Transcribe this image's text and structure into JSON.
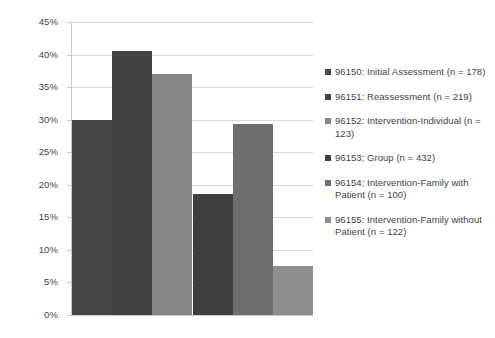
{
  "chart_data": {
    "type": "bar",
    "title": "",
    "subtitle": "",
    "xlabel": "",
    "ylabel": "",
    "ylim": [
      0,
      45
    ],
    "grid": true,
    "legend_position": "right",
    "y_tick_labels": [
      "45%",
      "40%",
      "35%",
      "30%",
      "25%",
      "20%",
      "15%",
      "10%",
      "5%",
      "0%"
    ],
    "y_tick_values": [
      45,
      40,
      35,
      30,
      25,
      20,
      15,
      10,
      5,
      0
    ],
    "x_tick_labels": [],
    "categories": [
      "96150: Initial Assessment (n = 178)",
      "96151: Reassessment (n = 219)",
      "96152: Intervention-Individual (n = 123)",
      "96153: Group (n = 432)",
      "96154: Intervention-Family with Patient (n = 100)",
      "96155: Intervention-Family without Patient (n = 122)"
    ],
    "values": [
      30.0,
      40.5,
      37.0,
      18.6,
      29.3,
      7.5
    ],
    "colors": [
      "#474747",
      "#434343",
      "#858585",
      "#3f3f3f",
      "#6e6e6e",
      "#8d8d8d"
    ]
  },
  "legend": {
    "items": [
      {
        "label": "96150: Initial Assessment (n = 178)",
        "color": "#474747"
      },
      {
        "label": "96151: Reassessment (n = 219)",
        "color": "#434343"
      },
      {
        "label": "96152: Intervention-Individual (n = 123)",
        "color": "#858585"
      },
      {
        "label": "96153: Group (n = 432)",
        "color": "#3f3f3f"
      },
      {
        "label": "96154: Intervention-Family with Patient (n = 100)",
        "color": "#6e6e6e"
      },
      {
        "label": "96155: Intervention-Family without Patient (n = 122)",
        "color": "#8d8d8d"
      }
    ]
  }
}
